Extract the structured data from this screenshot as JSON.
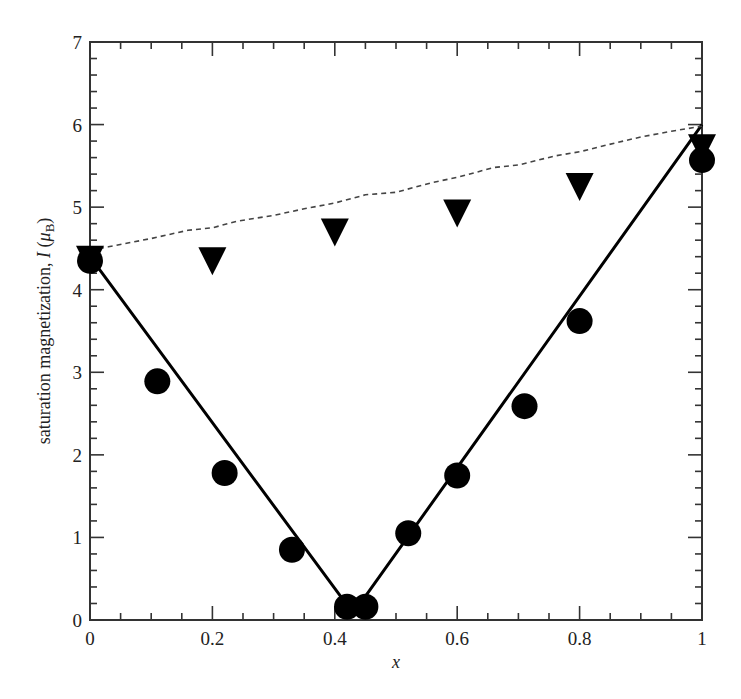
{
  "chart_data": {
    "type": "scatter",
    "title": "",
    "xlabel": "x",
    "ylabel": "saturation magnetization, I (μB)",
    "ylabel_parts": {
      "main": "saturation magnetization, ",
      "symbol": "I",
      "unit_open": " (",
      "unit_mu": "μ",
      "unit_sub": "B",
      "unit_close": ")"
    },
    "xlim": [
      0,
      1
    ],
    "ylim": [
      0,
      7
    ],
    "x_ticks": [
      0,
      0.2,
      0.4,
      0.6,
      0.8,
      1
    ],
    "x_tick_labels": [
      "0",
      "0.2",
      "0.4",
      "0.6",
      "0.8",
      "1"
    ],
    "x_minor_step": 0.05,
    "y_ticks": [
      0,
      1,
      2,
      3,
      4,
      5,
      6,
      7
    ],
    "y_tick_labels": [
      "0",
      "1",
      "2",
      "3",
      "4",
      "5",
      "6",
      "7"
    ],
    "y_minor_step": 0.2,
    "grid": false,
    "legend": null,
    "series": [
      {
        "name": "measured (circles)",
        "marker": "circle",
        "style": "markers",
        "color": "#000000",
        "points": [
          [
            0.0,
            4.35
          ],
          [
            0.11,
            2.89
          ],
          [
            0.22,
            1.78
          ],
          [
            0.33,
            0.85
          ],
          [
            0.42,
            0.16
          ],
          [
            0.45,
            0.16
          ],
          [
            0.52,
            1.05
          ],
          [
            0.6,
            1.75
          ],
          [
            0.71,
            2.59
          ],
          [
            0.8,
            3.62
          ],
          [
            1.0,
            5.57
          ]
        ]
      },
      {
        "name": "measured (triangles)",
        "marker": "triangle-down",
        "style": "markers",
        "color": "#000000",
        "points": [
          [
            0.0,
            4.4
          ],
          [
            0.2,
            4.38
          ],
          [
            0.4,
            4.73
          ],
          [
            0.6,
            4.96
          ],
          [
            0.8,
            5.28
          ],
          [
            1.0,
            5.75
          ]
        ]
      },
      {
        "name": "solid line (Slater-Pauling)",
        "style": "solid",
        "color": "#000000",
        "points": [
          [
            0.0,
            4.4
          ],
          [
            0.43,
            0.08
          ],
          [
            1.0,
            6.0
          ]
        ]
      },
      {
        "name": "dashed line",
        "style": "dashed",
        "color": "#444444",
        "points": [
          [
            0.0,
            4.48
          ],
          [
            0.03,
            4.52
          ],
          [
            0.1,
            4.62
          ],
          [
            0.16,
            4.72
          ],
          [
            0.2,
            4.75
          ],
          [
            0.24,
            4.83
          ],
          [
            0.3,
            4.9
          ],
          [
            0.35,
            4.98
          ],
          [
            0.4,
            5.05
          ],
          [
            0.45,
            5.15
          ],
          [
            0.5,
            5.18
          ],
          [
            0.56,
            5.3
          ],
          [
            0.6,
            5.36
          ],
          [
            0.66,
            5.48
          ],
          [
            0.7,
            5.51
          ],
          [
            0.76,
            5.62
          ],
          [
            0.8,
            5.67
          ],
          [
            0.86,
            5.78
          ],
          [
            0.9,
            5.85
          ],
          [
            0.95,
            5.92
          ],
          [
            1.0,
            5.98
          ]
        ]
      }
    ]
  },
  "layout": {
    "plot_left": 90,
    "plot_right": 702,
    "plot_top": 42,
    "plot_bottom": 620
  }
}
